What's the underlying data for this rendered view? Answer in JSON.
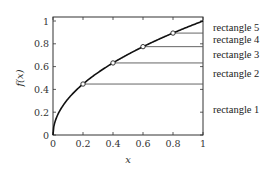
{
  "chart_data": {
    "type": "line",
    "title": "",
    "xlabel": "x",
    "ylabel": "f(x)",
    "xlim": [
      0,
      1
    ],
    "ylim": [
      0,
      1
    ],
    "grid": false,
    "function": "sqrt(x)",
    "x_ticks": [
      0,
      0.2,
      0.4,
      0.6,
      0.8,
      1
    ],
    "x_tick_labels": [
      "0",
      "0.2",
      "0.4",
      "0.6",
      "0.8",
      "1"
    ],
    "y_ticks": [
      0,
      0.2,
      0.4,
      0.6,
      0.8,
      1
    ],
    "y_tick_labels": [
      "0",
      "0.2",
      "0.4",
      "0.6",
      "0.8",
      "1"
    ],
    "markers": {
      "x": [
        0.2,
        0.4,
        0.6,
        0.8
      ],
      "y": [
        0.447,
        0.632,
        0.775,
        0.894
      ]
    },
    "horizontal_lines": [
      {
        "y": 0.447,
        "x_from": 0.2,
        "x_to": 1
      },
      {
        "y": 0.632,
        "x_from": 0.4,
        "x_to": 1
      },
      {
        "y": 0.775,
        "x_from": 0.6,
        "x_to": 1
      },
      {
        "y": 0.894,
        "x_from": 0.8,
        "x_to": 1
      }
    ],
    "annotations": [
      {
        "text": "rectangle 5",
        "y_range": [
          0.894,
          1.0
        ]
      },
      {
        "text": "rectangle 4",
        "y_range": [
          0.775,
          0.894
        ]
      },
      {
        "text": "rectangle 3",
        "y_range": [
          0.632,
          0.775
        ]
      },
      {
        "text": "rectangle 2",
        "y_range": [
          0.447,
          0.632
        ]
      },
      {
        "text": "rectangle 1",
        "y_range": [
          0.0,
          0.447
        ]
      }
    ]
  }
}
